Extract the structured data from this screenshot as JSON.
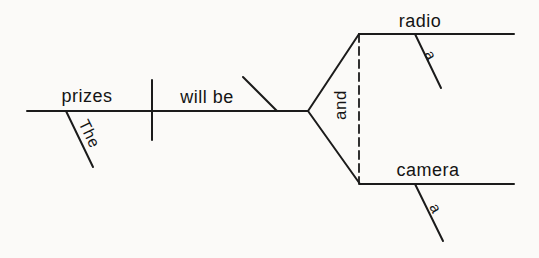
{
  "diagram": {
    "type": "sentence-diagram",
    "subject": {
      "word": "prizes",
      "modifier": "The"
    },
    "verb": {
      "phrase": "will be"
    },
    "conjunction": "and",
    "predicate_nominatives": [
      {
        "word": "radio",
        "modifier": "a"
      },
      {
        "word": "camera",
        "modifier": "a"
      }
    ]
  },
  "colors": {
    "background": "#fbfaf8",
    "line": "#1b1b1b",
    "text": "#141414"
  }
}
